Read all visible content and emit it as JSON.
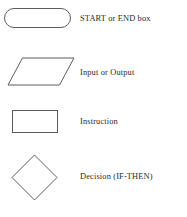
{
  "diagram": {
    "type": "flowchart-symbol-legend",
    "background_color": "#ffffff",
    "stroke_color": "#5c5c5c",
    "text_color": "#2b2b2b",
    "rows": [
      {
        "shape": "stadium",
        "shape_name": "rounded-terminator-shape",
        "label": "START or END box"
      },
      {
        "shape": "parallelogram",
        "shape_name": "parallelogram-shape",
        "label": "Input or Output"
      },
      {
        "shape": "rectangle",
        "shape_name": "rectangle-shape",
        "label": "Instruction"
      },
      {
        "shape": "diamond",
        "shape_name": "diamond-shape",
        "label": "Decision (IF-THEN)"
      }
    ]
  }
}
